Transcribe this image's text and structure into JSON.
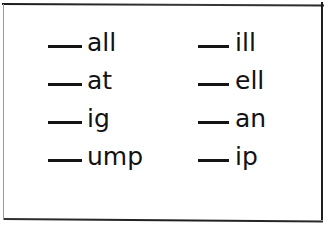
{
  "document": {
    "kind": "word-family-worksheet",
    "background_color": "#ffffff",
    "ink_color": "#121212",
    "border_color": "#1e1e1e"
  },
  "border": {
    "top_label": "top-border",
    "bottom_label": "bottom-border",
    "left_label": "left-border",
    "right_label": "right-border"
  },
  "columns": [
    {
      "id": "left",
      "items": [
        {
          "blank": "___",
          "ending": "all"
        },
        {
          "blank": "___",
          "ending": "at"
        },
        {
          "blank": "___",
          "ending": "ig"
        },
        {
          "blank": "___",
          "ending": "ump"
        }
      ]
    },
    {
      "id": "right",
      "items": [
        {
          "blank": "___",
          "ending": "ill"
        },
        {
          "blank": "___",
          "ending": "ell"
        },
        {
          "blank": "___",
          "ending": "an"
        },
        {
          "blank": "___",
          "ending": "ip"
        }
      ]
    }
  ]
}
